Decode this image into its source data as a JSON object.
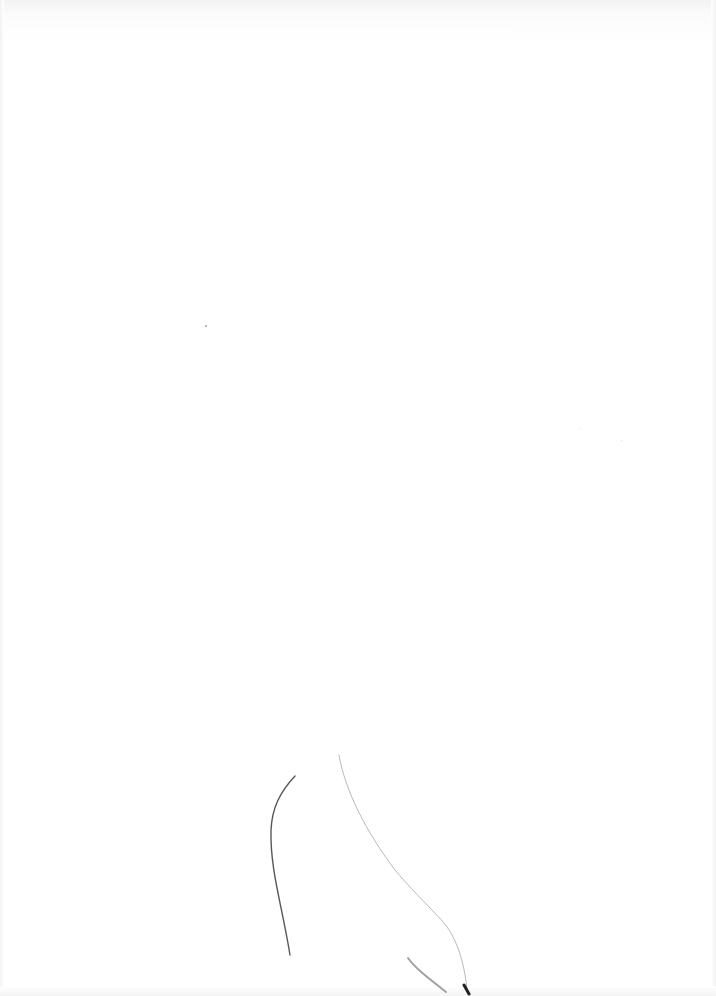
{
  "page": {
    "background_color": "#ffffff",
    "marks": [
      {
        "name": "stray-fiber-left",
        "color": "#3a3a3a"
      },
      {
        "name": "stray-fiber-right",
        "color": "#b0b0b0"
      },
      {
        "name": "stray-fiber-bottom",
        "color": "#6a6a6a"
      }
    ]
  }
}
